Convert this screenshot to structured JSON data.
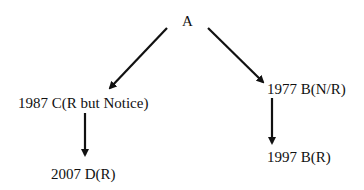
{
  "diagram": {
    "type": "tree",
    "nodes": {
      "root": {
        "id": "A",
        "label": "A"
      },
      "c1987": {
        "id": "C",
        "label": "1987 C(R but Notice)"
      },
      "d2007": {
        "id": "D",
        "label": "2007 D(R)"
      },
      "b1977": {
        "id": "B1977",
        "label": "1977 B(N/R)"
      },
      "b1997": {
        "id": "B1997",
        "label": "1997 B(R)"
      }
    },
    "edges": [
      {
        "from": "A",
        "to": "1987 C(R but Notice)"
      },
      {
        "from": "A",
        "to": "1977 B(N/R)"
      },
      {
        "from": "1987 C(R but Notice)",
        "to": "2007 D(R)"
      },
      {
        "from": "1977 B(N/R)",
        "to": "1997 B(R)"
      }
    ],
    "colors": {
      "line": "#111111",
      "text": "#111111",
      "background": "#ffffff"
    }
  }
}
